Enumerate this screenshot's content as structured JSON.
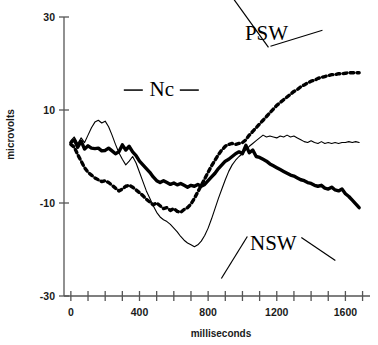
{
  "chart_data": {
    "type": "line",
    "title": "",
    "xlabel": "milliseconds",
    "ylabel": "microvolts",
    "xlim": [
      -40,
      1720
    ],
    "ylim": [
      -30,
      30
    ],
    "xticks": [
      0,
      400,
      800,
      1200,
      1600
    ],
    "xtick_labels": [
      "0",
      "400",
      "800",
      "1200",
      "1600"
    ],
    "xminor_step": 100,
    "yticks": [
      30,
      10,
      -10,
      -30
    ],
    "ytick_labels": [
      "30",
      "10",
      "-10",
      "-30"
    ],
    "grid": false,
    "legend_position": "none",
    "annotations": [
      {
        "text": "Nc",
        "x_ms": 530,
        "y_uv": 14.5,
        "style": "dashes-both-sides"
      },
      {
        "text": "PSW",
        "x_ms": 1140,
        "y_uv": 26.5,
        "style": "two-leader-lines"
      },
      {
        "text": "NSW",
        "x_ms": 1180,
        "y_uv": -18.5,
        "style": "two-leader-lines"
      }
    ],
    "series": [
      {
        "name": "thick-solid-trace",
        "line_style": "solid",
        "line_width": 3.4,
        "color": "#000000",
        "x": [
          0,
          20,
          40,
          60,
          80,
          100,
          120,
          140,
          160,
          180,
          200,
          220,
          240,
          260,
          280,
          300,
          320,
          340,
          360,
          380,
          400,
          420,
          440,
          460,
          480,
          500,
          520,
          540,
          560,
          580,
          600,
          620,
          640,
          660,
          680,
          700,
          720,
          740,
          760,
          780,
          800,
          820,
          840,
          860,
          880,
          900,
          920,
          940,
          960,
          980,
          1000,
          1020,
          1040,
          1060,
          1080,
          1100,
          1120,
          1140,
          1160,
          1180,
          1200,
          1220,
          1240,
          1260,
          1280,
          1300,
          1320,
          1340,
          1360,
          1380,
          1400,
          1420,
          1440,
          1460,
          1480,
          1500,
          1520,
          1540,
          1560,
          1580,
          1600,
          1620,
          1640,
          1660,
          1680
        ],
        "y": [
          3.0,
          3.6,
          2.0,
          3.3,
          1.6,
          2.3,
          1.8,
          1.7,
          1.8,
          1.2,
          1.3,
          1.8,
          1.2,
          0.6,
          1.0,
          2.5,
          1.4,
          2.2,
          1.0,
          0.2,
          -1.0,
          -1.8,
          -2.6,
          -3.4,
          -4.4,
          -5.2,
          -5.6,
          -5.2,
          -5.6,
          -6.0,
          -5.7,
          -6.1,
          -5.8,
          -6.2,
          -6.6,
          -6.2,
          -6.4,
          -6.0,
          -6.4,
          -6.0,
          -5.2,
          -4.4,
          -3.6,
          -2.6,
          -1.8,
          -1.0,
          -0.6,
          0.0,
          0.6,
          1.0,
          0.6,
          2.4,
          0.8,
          1.4,
          0.0,
          -0.2,
          -0.6,
          -1.0,
          -1.6,
          -2.0,
          -2.4,
          -2.8,
          -3.2,
          -3.6,
          -4.0,
          -4.2,
          -4.6,
          -5.0,
          -5.2,
          -5.6,
          -5.8,
          -6.2,
          -6.4,
          -6.2,
          -6.8,
          -7.0,
          -6.6,
          -7.2,
          -7.4,
          -7.0,
          -8.0,
          -8.6,
          -9.4,
          -10.2,
          -11.0
        ]
      },
      {
        "name": "dotted-trace",
        "line_style": "dotted",
        "line_width": 3.4,
        "color": "#000000",
        "x": [
          0,
          20,
          40,
          60,
          80,
          100,
          120,
          140,
          160,
          180,
          200,
          220,
          240,
          260,
          280,
          300,
          320,
          340,
          360,
          380,
          400,
          420,
          440,
          460,
          480,
          500,
          520,
          540,
          560,
          580,
          600,
          620,
          640,
          660,
          680,
          700,
          720,
          740,
          760,
          780,
          800,
          820,
          840,
          860,
          880,
          900,
          920,
          940,
          960,
          980,
          1000,
          1020,
          1040,
          1060,
          1080,
          1100,
          1120,
          1140,
          1160,
          1180,
          1200,
          1220,
          1240,
          1260,
          1280,
          1300,
          1320,
          1340,
          1360,
          1380,
          1400,
          1420,
          1440,
          1460,
          1480,
          1500,
          1520,
          1540,
          1560,
          1580,
          1600,
          1620,
          1640,
          1660,
          1680
        ],
        "y": [
          2.6,
          2.0,
          0.4,
          -1.0,
          -2.4,
          -3.4,
          -4.0,
          -4.6,
          -5.0,
          -5.4,
          -5.2,
          -5.6,
          -6.2,
          -6.8,
          -7.4,
          -7.0,
          -6.4,
          -6.2,
          -6.6,
          -7.2,
          -7.8,
          -8.4,
          -9.2,
          -9.8,
          -10.4,
          -10.0,
          -10.6,
          -11.2,
          -11.0,
          -11.6,
          -11.2,
          -11.8,
          -12.0,
          -11.4,
          -11.0,
          -10.2,
          -9.0,
          -7.6,
          -6.2,
          -4.8,
          -3.4,
          -2.0,
          -0.8,
          0.4,
          1.4,
          2.2,
          2.6,
          2.8,
          2.6,
          2.8,
          3.0,
          3.6,
          4.6,
          5.4,
          6.2,
          7.0,
          7.8,
          8.6,
          9.4,
          10.2,
          11.0,
          11.6,
          12.2,
          12.8,
          13.4,
          14.0,
          14.4,
          15.0,
          15.4,
          15.8,
          16.2,
          16.4,
          16.8,
          17.0,
          17.2,
          17.4,
          17.6,
          17.6,
          17.8,
          17.8,
          17.9,
          18.0,
          18.0,
          18.0,
          18.0
        ]
      },
      {
        "name": "thin-solid-trace",
        "line_style": "solid",
        "line_width": 1.1,
        "color": "#000000",
        "x": [
          0,
          20,
          40,
          60,
          80,
          100,
          120,
          140,
          160,
          180,
          200,
          220,
          240,
          260,
          280,
          300,
          320,
          340,
          360,
          380,
          400,
          420,
          440,
          460,
          480,
          500,
          520,
          540,
          560,
          580,
          600,
          620,
          640,
          660,
          680,
          700,
          720,
          740,
          760,
          780,
          800,
          820,
          840,
          860,
          880,
          900,
          920,
          940,
          960,
          980,
          1000,
          1020,
          1040,
          1060,
          1080,
          1100,
          1120,
          1140,
          1160,
          1180,
          1200,
          1220,
          1240,
          1260,
          1280,
          1300,
          1320,
          1340,
          1360,
          1380,
          1400,
          1420,
          1440,
          1460,
          1480,
          1500,
          1520,
          1540,
          1560,
          1580,
          1600,
          1620,
          1640,
          1660,
          1680
        ],
        "y": [
          3.4,
          4.2,
          2.8,
          4.0,
          3.0,
          4.6,
          6.2,
          7.4,
          7.8,
          7.2,
          7.6,
          6.4,
          4.6,
          2.6,
          0.8,
          -0.6,
          -1.8,
          -1.0,
          0.0,
          -1.4,
          -3.4,
          -5.4,
          -7.4,
          -9.0,
          -10.6,
          -12.0,
          -13.0,
          -13.6,
          -14.0,
          -14.6,
          -15.4,
          -16.2,
          -17.2,
          -18.0,
          -18.6,
          -19.0,
          -19.4,
          -19.0,
          -18.2,
          -17.0,
          -15.4,
          -13.4,
          -11.2,
          -9.0,
          -7.0,
          -5.0,
          -3.2,
          -1.8,
          -0.8,
          0.0,
          0.6,
          1.4,
          2.2,
          2.8,
          3.4,
          4.0,
          4.6,
          4.2,
          4.4,
          4.2,
          4.0,
          4.4,
          4.2,
          4.6,
          4.2,
          4.4,
          4.0,
          3.6,
          3.2,
          3.0,
          3.4,
          3.0,
          2.8,
          3.2,
          2.8,
          3.0,
          2.8,
          3.0,
          2.8,
          3.0,
          3.0,
          3.2,
          3.0,
          3.2,
          3.0
        ]
      }
    ]
  }
}
